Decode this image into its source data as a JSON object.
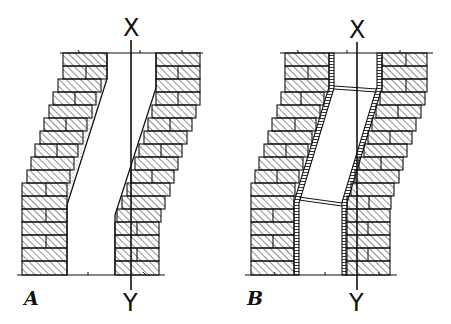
{
  "diagram": {
    "type": "technical-drawing",
    "axis_labels": {
      "top": "X",
      "bottom": "Y"
    },
    "figures": [
      {
        "id": "A",
        "label": "A",
        "description": "offset flue with sloped rendered (stippled) inner face"
      },
      {
        "id": "B",
        "label": "B",
        "description": "offset flue with flue liner and cross ties at bends"
      }
    ],
    "colors": {
      "line": "#111111",
      "background": "#ffffff",
      "hatch": "#333333",
      "stipple": "#555555"
    }
  }
}
